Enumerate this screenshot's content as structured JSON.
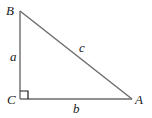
{
  "diagram": {
    "type": "right-triangle",
    "colors": {
      "edge": "#6b6b6b",
      "text": "#1a1a1a",
      "background": "#ffffff"
    },
    "vertices": [
      {
        "id": "B",
        "label": "B",
        "x": 20,
        "y": 11
      },
      {
        "id": "C",
        "label": "C",
        "x": 20,
        "y": 99
      },
      {
        "id": "A",
        "label": "A",
        "x": 132,
        "y": 99
      }
    ],
    "sides": [
      {
        "id": "a",
        "label": "a",
        "from": "B",
        "to": "C"
      },
      {
        "id": "b",
        "label": "b",
        "from": "C",
        "to": "A"
      },
      {
        "id": "c",
        "label": "c",
        "from": "B",
        "to": "A"
      }
    ],
    "right_angle_at": "C"
  }
}
